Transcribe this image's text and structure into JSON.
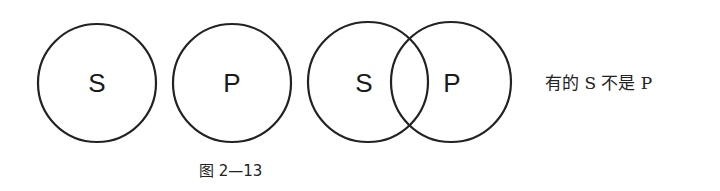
{
  "diagram": {
    "panels": [
      {
        "id": "separate",
        "circles": [
          {
            "label": "S",
            "cx": 97,
            "cy": 83,
            "r": 59
          },
          {
            "label": "P",
            "cx": 232,
            "cy": 83,
            "r": 59
          }
        ]
      },
      {
        "id": "overlap",
        "circles": [
          {
            "label": "S",
            "cx": 368,
            "cy": 82,
            "r": 60
          },
          {
            "label": "P",
            "cx": 451,
            "cy": 82,
            "r": 60
          }
        ]
      }
    ],
    "labels": {
      "c1": "S",
      "c2": "P",
      "c3": "S",
      "c4": "P"
    },
    "description": "有的 S 不是 P",
    "caption": "图 2—13",
    "colors": {
      "stroke": "#222222",
      "text": "#1a1a1a",
      "background": "#ffffff"
    }
  }
}
